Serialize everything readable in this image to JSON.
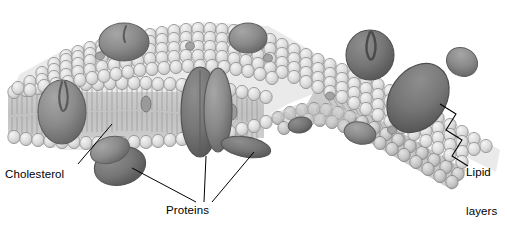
{
  "figure": {
    "background_color": "#ffffff"
  },
  "labels": [
    {
      "id": "cholesterol",
      "text": "Cholesterol",
      "x": 5,
      "y": 168
    },
    {
      "id": "proteins",
      "text": "Proteins",
      "x": 166,
      "y": 204
    },
    {
      "id": "lipid_layers",
      "line1": "Lipid",
      "line2": "layers",
      "x": 466,
      "y": 140
    }
  ],
  "colors": {
    "head_light": "#e2e2e2",
    "head_mid": "#cfcfcf",
    "head_dark": "#b4b4b4",
    "tail": "#b9b9b9",
    "protein_fill": "#8a8a8a",
    "protein_dark": "#6e6e6e",
    "outline": "#5a5a5a",
    "leader": "#000000",
    "bracket": "#000000"
  },
  "structures": {
    "upper_leaflet": "phospholipid head groups, perspective top face",
    "lower_leaflet": "phospholipid head groups, underside face",
    "tails": "hydrophobic fatty acid tails between leaflets",
    "integral_proteins": 7,
    "peripheral_proteins": 3,
    "cholesterol_molecules": "small dark units embedded within bilayer interior"
  }
}
